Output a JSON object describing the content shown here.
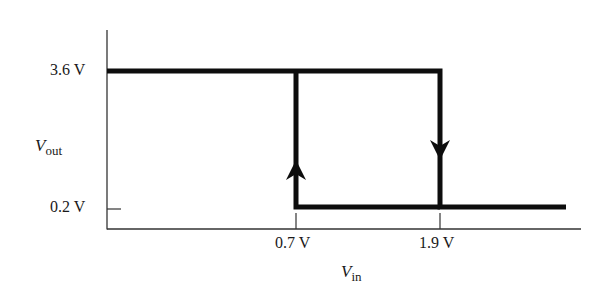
{
  "diagram": {
    "type": "hysteresis transfer characteristic",
    "y_axis": {
      "symbol": "V",
      "subscript": "out",
      "ticks": [
        "3.6 V",
        "0.2 V"
      ]
    },
    "x_axis": {
      "symbol": "V",
      "subscript": "in",
      "ticks": [
        "0.7 V",
        "1.9 V"
      ]
    },
    "levels": {
      "high": "3.6 V",
      "low": "0.2 V"
    },
    "thresholds": {
      "rising": "1.9 V",
      "falling": "0.7 V"
    },
    "arrows": [
      {
        "at": "0.7 V",
        "direction": "up"
      },
      {
        "at": "1.9 V",
        "direction": "down"
      }
    ],
    "colors": {
      "curve": "#0d0d0d",
      "axis": "#333333",
      "background": "#ffffff"
    }
  }
}
